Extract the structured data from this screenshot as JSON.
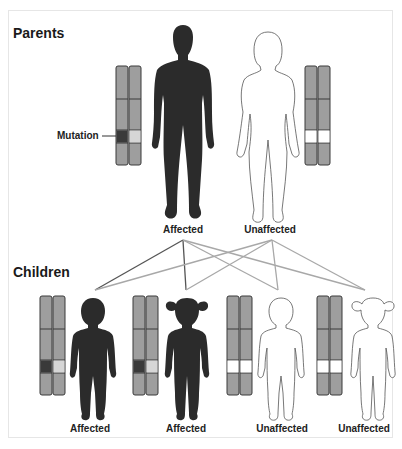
{
  "sections": {
    "parents_title": "Parents",
    "children_title": "Children"
  },
  "annotations": {
    "mutation_label": "Mutation"
  },
  "colors": {
    "affected_fill": "#2b2b2b",
    "chromosome_fill": "#9e9e9e",
    "chromosome_stroke": "#3a3a3a",
    "mutation_band": "#3a3a3a",
    "normal_band_light": "#d6d6d6",
    "normal_band_white": "#ffffff",
    "line_from_affected_mutation": "#555555",
    "line_other": "#a8a8a8",
    "frame_border": "#e6e6e6"
  },
  "parents": [
    {
      "id": "father",
      "figure": "adult-male",
      "status": "Affected",
      "chromosome_bands": [
        "mutation",
        "light"
      ]
    },
    {
      "id": "mother",
      "figure": "adult-female",
      "status": "Unaffected",
      "chromosome_bands": [
        "white",
        "white"
      ]
    }
  ],
  "children": [
    {
      "id": "child-1",
      "figure": "boy",
      "status": "Affected",
      "chromosome_bands": [
        "mutation",
        "light"
      ]
    },
    {
      "id": "child-2",
      "figure": "girl",
      "status": "Affected",
      "chromosome_bands": [
        "mutation",
        "light"
      ]
    },
    {
      "id": "child-3",
      "figure": "boy",
      "status": "Unaffected",
      "chromosome_bands": [
        "white",
        "white"
      ]
    },
    {
      "id": "child-4",
      "figure": "girl",
      "status": "Unaffected",
      "chromosome_bands": [
        "white",
        "white"
      ]
    }
  ]
}
